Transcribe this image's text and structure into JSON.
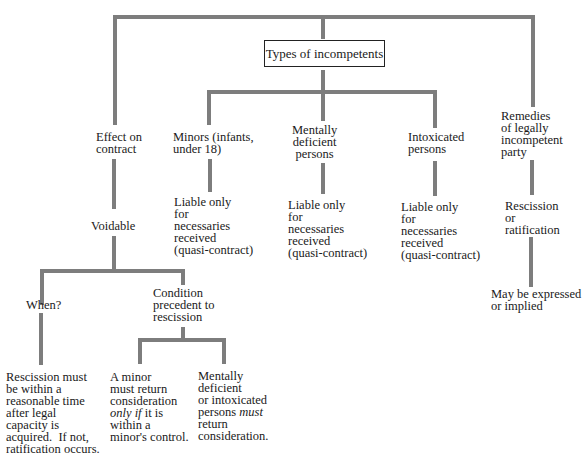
{
  "root": {
    "label": "Types of incompetents"
  },
  "effect": {
    "label": "Effect on\ncontract",
    "voidable": "Voidable",
    "when": {
      "label": "When?",
      "detail": "Rescission must\nbe within a\nreasonable time\nafter legal\ncapacity is\nacquired.  If not,\nratification occurs."
    },
    "condition": {
      "label": "Condition\nprecedent to\nrescission",
      "minor": {
        "line1": "A minor\nmust return\nconsideration",
        "italic": "only if",
        "line2": " it is\nwithin a\nminor's control."
      },
      "mental": {
        "line1": "Mentally\ndeficient\nor intoxicated\npersons ",
        "italic": "must",
        "line2": "\nreturn\nconsideration."
      }
    }
  },
  "types": [
    {
      "label": "Minors (infants,\nunder 18)",
      "detail": "Liable only\nfor\nnecessaries\nreceived\n(quasi-contract)"
    },
    {
      "label": "Mentally\ndeficient\npersons",
      "detail": "Liable only\nfor\nnecessaries\nreceived\n(quasi-contract)"
    },
    {
      "label": "Intoxicated\npersons",
      "detail": "Liable only\nfor\nnecessaries\nreceived\n(quasi-contract)"
    }
  ],
  "remedies": {
    "label": "Remedies\nof legally\nincompetent\nparty",
    "option": "Rescission\nor\nratification",
    "note": "May be expressed\nor implied"
  },
  "colors": {
    "connector": "#7d7d7d",
    "text": "#1a1a1a"
  }
}
